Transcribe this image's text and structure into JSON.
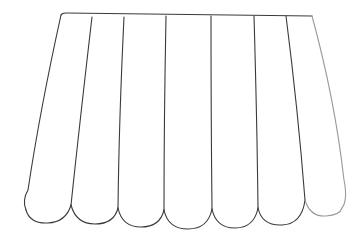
{
  "drawing": {
    "subject": "awning-outline",
    "stroke_color": "#3a3a3a",
    "background": "#ffffff",
    "stripe_count": 7
  }
}
